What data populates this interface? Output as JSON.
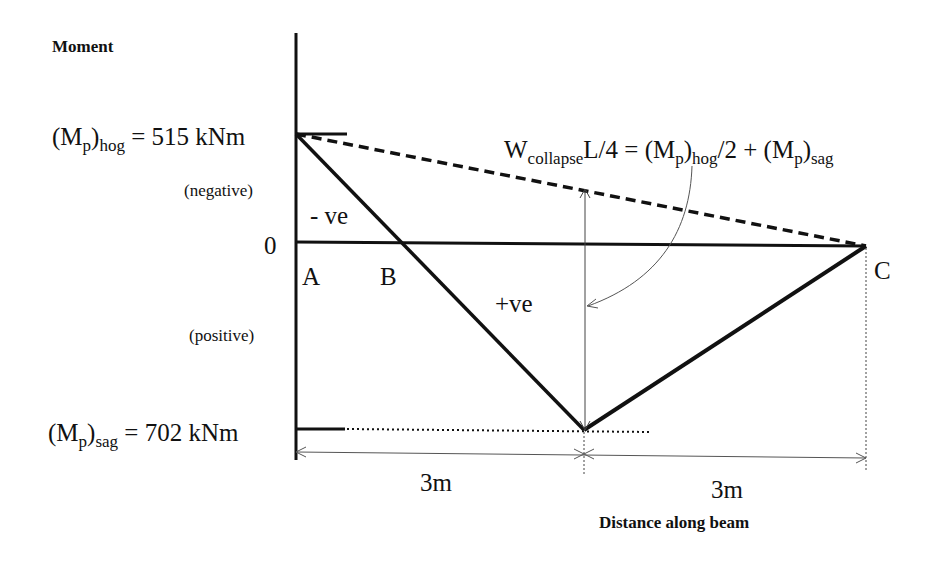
{
  "axis": {
    "y_label": "Moment",
    "x_label": "Distance along beam",
    "zero_label": "0"
  },
  "levels": {
    "hog": {
      "symbol": "M",
      "sub1": "p",
      "sub2": "hog",
      "value_text": "= 515 kNm",
      "value": 515,
      "unit": "kNm"
    },
    "sag": {
      "symbol": "M",
      "sub1": "p",
      "sub2": "sag",
      "value_text": "= 702 kNm",
      "value": 702,
      "unit": "kNm"
    },
    "negative_label": "(negative)",
    "positive_label": "(positive)"
  },
  "regions": {
    "neg": "- ve",
    "pos": "+ve"
  },
  "points": {
    "A": "A",
    "B": "B",
    "C": "C"
  },
  "formula": {
    "w": "W",
    "w_sub": "collapse",
    "mid": "L/4 = (M",
    "p1": "p",
    ")": ")",
    "hog": "hog",
    "half": "/2 + (M",
    "p2": "p",
    "sag": "sag"
  },
  "dimensions": {
    "span1": "3m",
    "span2": "3m"
  },
  "colors": {
    "line": "#111111",
    "thin": "#555555",
    "background": "#ffffff"
  }
}
